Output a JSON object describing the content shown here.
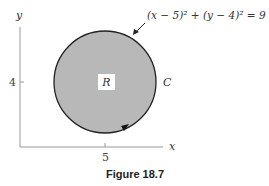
{
  "figure": {
    "caption": "Figure 18.7",
    "equation": "(x − 5)² + (y − 4)² = 9",
    "region_label": "R",
    "curve_label": "C",
    "axes": {
      "x_label": "x",
      "y_label": "y",
      "x_tick": "5",
      "y_tick": "4"
    },
    "colors": {
      "fill": "#b8b8b8",
      "stroke": "#222222",
      "axis": "#999999"
    },
    "orientation": "counterclockwise"
  }
}
